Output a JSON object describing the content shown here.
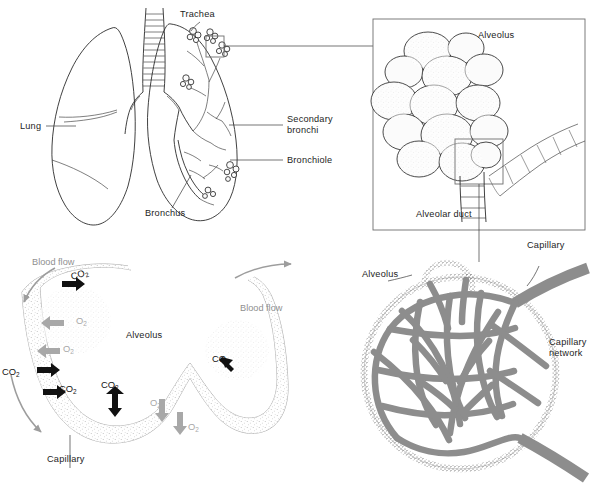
{
  "figure": {
    "background": "#ffffff",
    "ink": "#1d1d1d",
    "grey": "#8d8d8d"
  },
  "panels": {
    "lung": {
      "name": "Lung anatomy panel",
      "labels": {
        "trachea": "Trachea",
        "lung": "Lung",
        "secondary_bronchi_line1": "Secondary",
        "secondary_bronchi_line2": "bronchi",
        "bronchiole": "Bronchiole",
        "bronchus": "Bronchus"
      }
    },
    "alveolus_cluster": {
      "name": "Alveolar sac detail panel",
      "labels": {
        "alveolus": "Alveolus",
        "alveolar_duct": "Alveolar duct"
      }
    },
    "gas_exchange": {
      "name": "Alveolar gas exchange panel",
      "labels": {
        "alveolus": "Alveolus",
        "capillary": "Capillary",
        "blood_flow_left": "Blood flow",
        "blood_flow_right": "Blood flow"
      },
      "gas_markers": [
        {
          "id": "co2-top",
          "species": "CO",
          "subscript": "2",
          "tone": "dark",
          "direction": "right"
        },
        {
          "id": "o2-upper",
          "species": "O",
          "subscript": "2",
          "tone": "grey",
          "direction": "left"
        },
        {
          "id": "o2-upper-2",
          "species": "O",
          "subscript": "2",
          "tone": "grey",
          "direction": "left"
        },
        {
          "id": "co2-left-upper",
          "species": "CO",
          "subscript": "2",
          "tone": "dark",
          "direction": "right"
        },
        {
          "id": "co2-left-lower",
          "species": "CO",
          "subscript": "2",
          "tone": "dark",
          "direction": "right"
        },
        {
          "id": "co2-bottom-up",
          "species": "CO",
          "subscript": "2",
          "tone": "dark",
          "direction": "up"
        },
        {
          "id": "co2-right",
          "species": "CO",
          "subscript": "2",
          "tone": "dark",
          "direction": "upleft"
        },
        {
          "id": "o2-lower-1",
          "species": "O",
          "subscript": "2",
          "tone": "grey",
          "direction": "down"
        },
        {
          "id": "o2-lower-2",
          "species": "O",
          "subscript": "2",
          "tone": "grey",
          "direction": "down"
        }
      ]
    },
    "capillary_network": {
      "name": "Alveolus with capillary network panel",
      "labels": {
        "alveolus": "Alveolus",
        "capillary": "Capillary",
        "capillary_network_line1": "Capillary",
        "capillary_network_line2": "network"
      }
    }
  }
}
